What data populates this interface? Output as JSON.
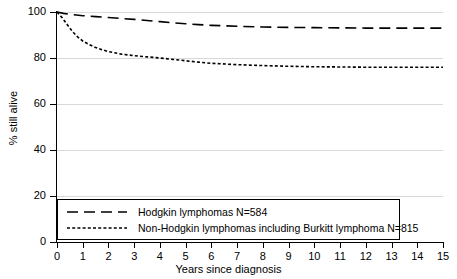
{
  "chart_data": {
    "type": "line",
    "title": "",
    "xlabel": "Years since diagnosis",
    "ylabel": "% still alive",
    "xlim": [
      0,
      15
    ],
    "ylim": [
      0,
      100
    ],
    "xticks": [
      "0",
      "1",
      "2",
      "3",
      "4",
      "5",
      "6",
      "7",
      "8",
      "9",
      "10",
      "11",
      "12",
      "13",
      "14",
      "15"
    ],
    "yticks": [
      "0",
      "20",
      "40",
      "60",
      "80",
      "100"
    ],
    "grid": "horizontal",
    "legend_position": "bottom-left-inside",
    "series": [
      {
        "name": "Hodgkin lymphomas N=584",
        "label": "Hodgkin lymphomas N=584",
        "n": 584,
        "style": "long-dash",
        "color": "#000000",
        "x": [
          0,
          0.25,
          0.5,
          0.75,
          1,
          1.5,
          2,
          2.5,
          3,
          3.5,
          4,
          4.5,
          5,
          5.5,
          6,
          7,
          8,
          9,
          10,
          11,
          12,
          13,
          14,
          15
        ],
        "y": [
          100,
          99.4,
          99.0,
          98.7,
          98.4,
          98.0,
          97.6,
          97.2,
          96.8,
          96.3,
          95.8,
          95.3,
          94.9,
          94.5,
          94.2,
          93.8,
          93.5,
          93.3,
          93.2,
          93.1,
          93.0,
          93.0,
          93.0,
          93.0
        ]
      },
      {
        "name": "Non-Hodgkin lymphomas including Burkitt lymphoma N=815",
        "label": "Non-Hodgkin lymphomas including Burkitt lymphoma N=815",
        "n": 815,
        "style": "dotted",
        "color": "#000000",
        "x": [
          0,
          0.2,
          0.4,
          0.6,
          0.8,
          1,
          1.25,
          1.5,
          1.75,
          2,
          2.5,
          3,
          3.5,
          4,
          4.5,
          5,
          5.5,
          6,
          7,
          8,
          9,
          10,
          11,
          12,
          13,
          14,
          15
        ],
        "y": [
          100,
          97.5,
          94.5,
          91.5,
          89.2,
          87.4,
          85.8,
          84.6,
          83.6,
          82.8,
          81.7,
          81.0,
          80.5,
          80.0,
          79.4,
          78.8,
          78.2,
          77.7,
          77.1,
          76.7,
          76.4,
          76.2,
          76.1,
          76.0,
          76.0,
          76.0,
          76.0
        ]
      }
    ],
    "legend": [
      {
        "label": "Hodgkin lymphomas N=584",
        "style": "long-dash"
      },
      {
        "label": "Non-Hodgkin lymphomas including Burkitt lymphoma N=815",
        "style": "dotted"
      }
    ]
  }
}
